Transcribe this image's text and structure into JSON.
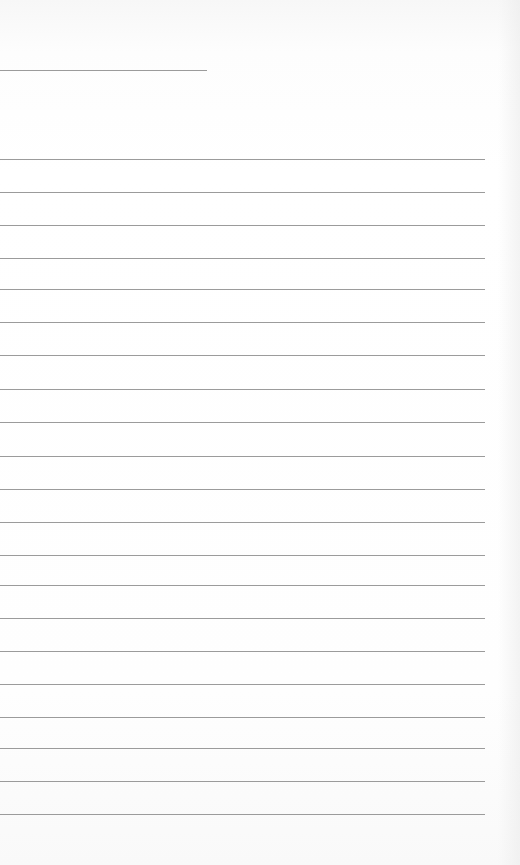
{
  "document": {
    "type": "lined-paper",
    "background_color": "#ffffff",
    "line_color": "#8a8a8a",
    "header_line": {
      "y": 70,
      "x_start": 0,
      "x_end": 207
    },
    "body_lines": {
      "x_start": 0,
      "x_end": 485,
      "y_positions": [
        159,
        192,
        225,
        258,
        289,
        322,
        355,
        389,
        422,
        456,
        489,
        522,
        555,
        585,
        618,
        651,
        684,
        717,
        748,
        781,
        814
      ]
    },
    "text": []
  }
}
